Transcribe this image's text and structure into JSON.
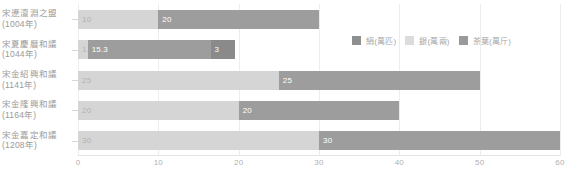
{
  "chart_data": {
    "type": "bar",
    "orientation": "horizontal",
    "stacked": true,
    "title": "",
    "xlabel": "",
    "ylabel": "",
    "xlim": [
      0,
      60
    ],
    "xticks": [
      "0",
      "10",
      "20",
      "30",
      "40",
      "50",
      "60"
    ],
    "grid": true,
    "legend_position": "top-right",
    "categories": [
      {
        "line1": "宋遼澶淵之盟",
        "line2": "(1004年)"
      },
      {
        "line1": "宋夏慶曆和議",
        "line2": "(1044年)"
      },
      {
        "line1": "宋金紹興和議",
        "line2": "(1141年)"
      },
      {
        "line1": "宋金隆興和議",
        "line2": "(1164年)"
      },
      {
        "line1": "宋金嘉定和議",
        "line2": "(1208年)"
      }
    ],
    "series": [
      {
        "name": "絹(萬匹)",
        "color": "#d5d5d5",
        "values": [
          10,
          1.2,
          25,
          20,
          30
        ]
      },
      {
        "name": "銀(萬兩)",
        "color": "#9d9d9d",
        "values": [
          20,
          15.3,
          25,
          20,
          30
        ]
      },
      {
        "name": "茶葉(萬斤)",
        "color": "#8a8a8a",
        "values": [
          0,
          3,
          0,
          0,
          0
        ]
      }
    ],
    "bar_labels": [
      [
        "10",
        "20",
        ""
      ],
      [
        "1.2",
        "15.3",
        "3"
      ],
      [
        "25",
        "25",
        ""
      ],
      [
        "20",
        "20",
        ""
      ],
      [
        "30",
        "30",
        ""
      ]
    ],
    "legend": [
      {
        "label": "絹(萬匹)",
        "color": "#8f8f8f"
      },
      {
        "label": "銀(萬兩)",
        "color": "#dcdcdc"
      },
      {
        "label": "茶葉(萬斤)",
        "color": "#9a9a9a"
      }
    ],
    "colors": {
      "segment_light": "#d5d5d5",
      "segment_dark": "#9d9d9d",
      "segment_third": "#8a8a8a",
      "gridline": "#ededed",
      "tick_text": "#b0b0b0",
      "label_text": "#9a9a9a"
    }
  }
}
